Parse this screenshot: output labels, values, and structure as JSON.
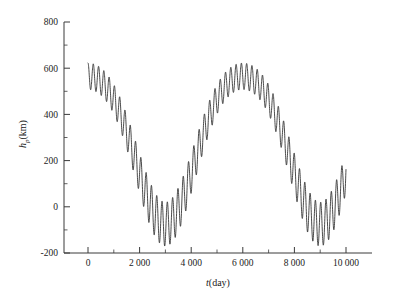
{
  "figure": {
    "background_color": "#ffffff",
    "line_color": "#2b2b2b",
    "axis_color": "#3a3a3a"
  },
  "axes": {
    "x_label_parts": {
      "symbol": "t",
      "unit": "(day)"
    },
    "y_label_parts": {
      "symbol": "h",
      "subscript": "p",
      "unit": "(km)"
    },
    "x_ticks": [
      "0",
      "2 000",
      "4 000",
      "6 000",
      "8 000",
      "10 000"
    ],
    "y_ticks": [
      "800",
      "600",
      "400",
      "200",
      "0",
      "-200"
    ]
  },
  "chart_data": {
    "type": "line",
    "title": "",
    "xlabel": "t(day)",
    "ylabel": "h_p(km)",
    "xlim": [
      -500,
      10500
    ],
    "ylim": [
      -200,
      800
    ],
    "x_tick_values": [
      0,
      2000,
      4000,
      6000,
      8000,
      10000
    ],
    "y_tick_values": [
      -200,
      0,
      200,
      400,
      600,
      800
    ],
    "x_minor_ticks": [
      1000,
      3000,
      5000,
      7000,
      9000
    ],
    "y_minor_ticks": [
      -100,
      100,
      300,
      500,
      700
    ],
    "grid": false,
    "legend": null,
    "series": [
      {
        "name": "perigee altitude",
        "description": "Long-period envelope (~6000 day period) modulated by short-period oscillation (~200 day period); envelope mean decreases from about 600 km at t=0 to about -30 km near t=3000 d, rises to a maximum near 600 km at t=6000 d, falls again to about -40 km near t=9000 d, then rises to about 60 km at t=10000 d. Short-period amplitude grows from about 60 km at t=0 to about 90 km near the envelope minima.",
        "model": {
          "envelope_mean": {
            "form": "cosine",
            "amplitude": 320,
            "offset": 285,
            "period_days": 6000,
            "phase_days": 0,
            "secondary_amplitude": 40,
            "secondary_period_days": 3000
          },
          "ripple": {
            "form": "cosine",
            "amplitude_min": 55,
            "amplitude_max": 95,
            "period_days": 205,
            "phase_days": 0
          }
        },
        "x_start": 0,
        "x_end": 10000,
        "sample_count": 2400,
        "key_points": [
          {
            "x": 0,
            "y": 700
          },
          {
            "x": 100,
            "y": 545
          },
          {
            "x": 205,
            "y": 625
          },
          {
            "x": 620,
            "y": 505
          },
          {
            "x": 1030,
            "y": 410
          },
          {
            "x": 1450,
            "y": 300
          },
          {
            "x": 1860,
            "y": 185
          },
          {
            "x": 2280,
            "y": 90
          },
          {
            "x": 2700,
            "y": 35
          },
          {
            "x": 3100,
            "y": 30
          },
          {
            "x": 3100,
            "y": -125
          },
          {
            "x": 3500,
            "y": 45
          },
          {
            "x": 3900,
            "y": 85
          },
          {
            "x": 4300,
            "y": 165
          },
          {
            "x": 4700,
            "y": 260
          },
          {
            "x": 5100,
            "y": 375
          },
          {
            "x": 5500,
            "y": 505
          },
          {
            "x": 5900,
            "y": 640
          },
          {
            "x": 6050,
            "y": 710
          },
          {
            "x": 6400,
            "y": 600
          },
          {
            "x": 6800,
            "y": 480
          },
          {
            "x": 7200,
            "y": 360
          },
          {
            "x": 7600,
            "y": 230
          },
          {
            "x": 8000,
            "y": 120
          },
          {
            "x": 8400,
            "y": 45
          },
          {
            "x": 8900,
            "y": -5
          },
          {
            "x": 9000,
            "y": -130
          },
          {
            "x": 9400,
            "y": 10
          },
          {
            "x": 9800,
            "y": 70
          },
          {
            "x": 10000,
            "y": 130
          }
        ]
      }
    ]
  }
}
